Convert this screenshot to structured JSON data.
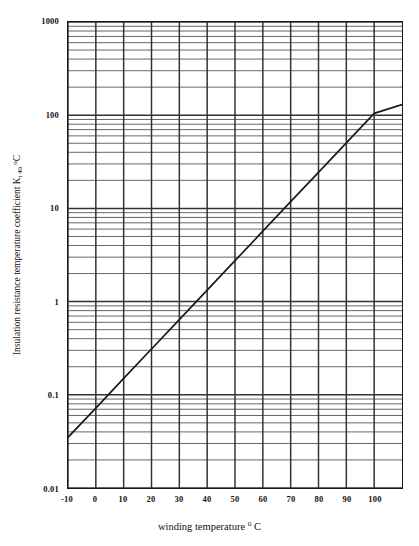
{
  "chart_data": {
    "type": "line",
    "title": "",
    "xlabel": "winding temperature ° C",
    "ylabel": "Insulation resistance temperature coefficient Kt 40 °C",
    "ylabel_parts": {
      "main": "Insulation resistance temperature coefficient K",
      "subscript": "t 40",
      "degree": "o",
      "unit": "C"
    },
    "xlabel_parts": {
      "main": "winding temperature",
      "degree": "o",
      "unit": "C"
    },
    "yscale": "log",
    "xscale": "linear",
    "xlim": [
      -10,
      110
    ],
    "ylim": [
      0.01,
      1000
    ],
    "grid": true,
    "grid_minor": true,
    "legend": "none",
    "xticks": [
      -10,
      0,
      10,
      20,
      30,
      40,
      50,
      60,
      70,
      80,
      90,
      100
    ],
    "xtick_labels": [
      "-10",
      "0",
      "10",
      "20",
      "30",
      "40",
      "50",
      "60",
      "70",
      "80",
      "90",
      "100"
    ],
    "yticks": [
      0.01,
      0.1,
      1,
      10,
      100,
      1000
    ],
    "ytick_labels": [
      "0.01",
      "0.1",
      "1",
      "10",
      "100",
      "1000"
    ],
    "series": [
      {
        "name": "Insulation resistance temperature coefficient",
        "x": [
          -10,
          0,
          10,
          20,
          30,
          40,
          50,
          60,
          70,
          80,
          90,
          100,
          110
        ],
        "y": [
          0.035,
          0.072,
          0.15,
          0.31,
          0.64,
          1.33,
          2.75,
          5.7,
          11.8,
          24.4,
          50.5,
          104.6,
          130.0
        ]
      }
    ],
    "colors": {
      "line": "#1a1a1a",
      "grid": "#4d4d4d",
      "grid_minor": "#666666",
      "axis": "#1a1a1a",
      "background": "#ffffff",
      "text": "#111111"
    }
  }
}
